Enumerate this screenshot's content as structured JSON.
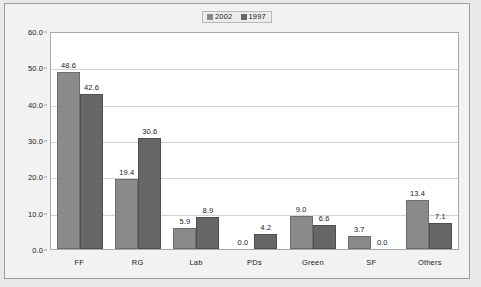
{
  "chart_data": {
    "type": "bar",
    "title": "",
    "subtitle": "",
    "xlabel": "",
    "ylabel": "",
    "categories": [
      "FF",
      "RG",
      "Lab",
      "PDs",
      "Green",
      "SF",
      "Others"
    ],
    "series": [
      {
        "name": "2002",
        "color": "#8a8a8a",
        "values": [
          48.6,
          19.4,
          5.9,
          0.0,
          9.0,
          3.7,
          13.4
        ],
        "labels": [
          "48.6",
          "19.4",
          "5.9",
          "0.0",
          "9.0",
          "3.7",
          "13.4"
        ]
      },
      {
        "name": "1997",
        "color": "#666666",
        "values": [
          42.6,
          30.6,
          8.9,
          4.2,
          6.6,
          0.0,
          7.1
        ],
        "labels": [
          "42.6",
          "30.6",
          "8.9",
          "4.2",
          "6.6",
          "0.0",
          "7.1"
        ]
      }
    ],
    "ylim": [
      0.0,
      60.0
    ],
    "ytick_step": 10.0,
    "yticks": [
      60.0,
      50.0,
      40.0,
      30.0,
      20.0,
      10.0,
      0.0
    ],
    "ytick_labels": [
      "60.0",
      "50.0",
      "40.0",
      "30.0",
      "20.0",
      "10.0",
      "0.0"
    ],
    "grid": true,
    "grid_axis": "y",
    "legend_position": "top-center",
    "legend_entries": [
      "2002",
      "1997"
    ],
    "data_labels": true
  }
}
